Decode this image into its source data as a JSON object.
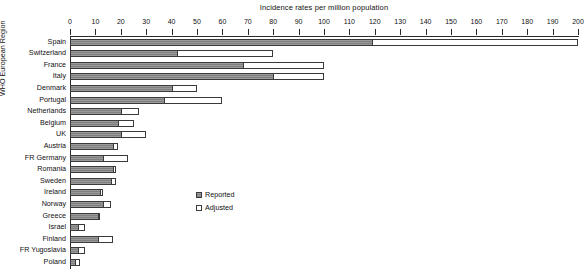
{
  "chart_data": {
    "type": "bar",
    "orientation": "horizontal",
    "title": "Incidence rates per million population",
    "xlabel": "",
    "ylabel": "WHO European Region",
    "xlim": [
      0,
      200
    ],
    "xticks": [
      0,
      10,
      20,
      30,
      40,
      50,
      60,
      70,
      80,
      90,
      100,
      110,
      120,
      130,
      140,
      150,
      160,
      170,
      180,
      190,
      200
    ],
    "grid": false,
    "legend_position": "center-left",
    "categories": [
      "Spain",
      "Switzerland",
      "France",
      "Italy",
      "Denmark",
      "Portugal",
      "Netherlands",
      "Belgium",
      "UK",
      "Austria",
      "FR Germany",
      "Romania",
      "Sweden",
      "Ireland",
      "Norway",
      "Greece",
      "Israel",
      "Finland",
      "FR Yugoslavia",
      "Poland"
    ],
    "series": [
      {
        "name": "Reported",
        "color": "#8c8c8c",
        "values": [
          119,
          42,
          68,
          80,
          40,
          37,
          20,
          19,
          20,
          17,
          13,
          17,
          16,
          12,
          13,
          11,
          3,
          11,
          3,
          2
        ]
      },
      {
        "name": "Adjusted",
        "color": "#ffffff",
        "values": [
          200,
          80,
          100,
          100,
          50,
          60,
          27,
          25,
          30,
          19,
          23,
          18,
          18,
          13,
          16,
          12,
          6,
          17,
          6,
          4
        ]
      }
    ]
  },
  "legend": {
    "items": [
      {
        "label": "Reported",
        "style": "filled"
      },
      {
        "label": "Adjusted",
        "style": "hollow"
      }
    ]
  },
  "colors": {
    "axis": "#2a2a2a",
    "bar_border": "#3a3a3a",
    "reported_fill": "#8c8c8c",
    "adjusted_fill": "#ffffff",
    "background": "#ffffff",
    "text": "#111111"
  }
}
